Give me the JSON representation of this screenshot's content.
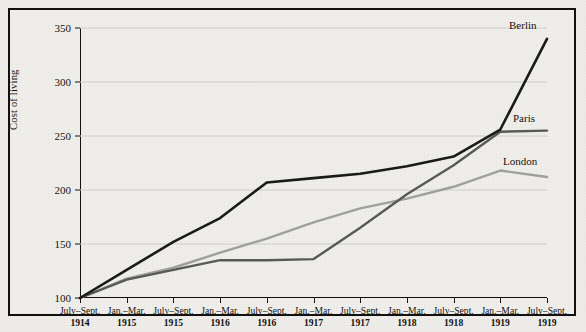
{
  "chart_data": {
    "type": "line",
    "title": "",
    "xlabel": "",
    "ylabel": "Cost of living",
    "ylim": [
      100,
      350
    ],
    "yticks": [
      100,
      150,
      200,
      250,
      300,
      350
    ],
    "grid": true,
    "legend_position": "inline-right",
    "categories": [
      {
        "period": "July–Sept.",
        "year": "1914"
      },
      {
        "period": "Jan.–Mar.",
        "year": "1915"
      },
      {
        "period": "July–Sept.",
        "year": "1915"
      },
      {
        "period": "Jan.–Mar.",
        "year": "1916"
      },
      {
        "period": "July–Sept.",
        "year": "1916"
      },
      {
        "period": "Jan.–Mar.",
        "year": "1917"
      },
      {
        "period": "July–Sept.",
        "year": "1917"
      },
      {
        "period": "Jan.–Mar.",
        "year": "1918"
      },
      {
        "period": "July–Sept.",
        "year": "1918"
      },
      {
        "period": "Jan.–Mar.",
        "year": "1919"
      },
      {
        "period": "July–Sept.",
        "year": "1919"
      }
    ],
    "series": [
      {
        "name": "Berlin",
        "color": "#1a1a1a",
        "width": 2.6,
        "values": [
          100,
          126,
          152,
          174,
          207,
          211,
          215,
          222,
          231,
          256,
          340
        ]
      },
      {
        "name": "Paris",
        "color": "#595959",
        "width": 2.4,
        "values": [
          100,
          117,
          126,
          135,
          135,
          136,
          165,
          196,
          223,
          254,
          255
        ]
      },
      {
        "name": "London",
        "color": "#a0a0a0",
        "width": 2.4,
        "values": [
          100,
          118,
          128,
          142,
          155,
          170,
          183,
          192,
          203,
          218,
          212
        ]
      }
    ]
  },
  "figure": {
    "background_color": "#efeeea",
    "grid_color": "#cfcecb",
    "axis_color": "#13110f",
    "border_color": "#13110f"
  }
}
